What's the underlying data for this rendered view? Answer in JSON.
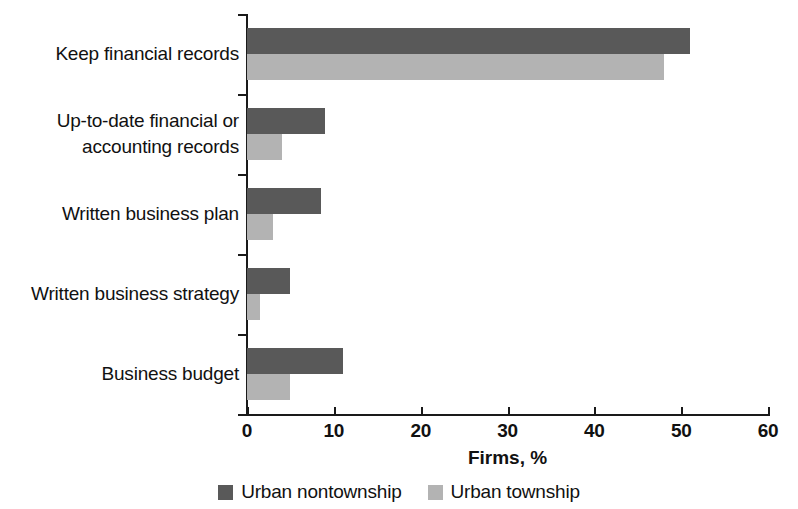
{
  "chart_data": {
    "type": "bar",
    "orientation": "horizontal",
    "title": "",
    "xlabel": "Firms, %",
    "ylabel": "",
    "xlim": [
      0,
      60
    ],
    "xticks": [
      0,
      10,
      20,
      30,
      40,
      50,
      60
    ],
    "grid": false,
    "legend_position": "bottom",
    "categories": [
      "Keep financial records",
      "Up-to-date financial or accounting records",
      "Written business plan",
      "Written business strategy",
      "Business budget"
    ],
    "category_label_lines": [
      [
        "Keep financial records"
      ],
      [
        "Up-to-date financial or",
        "accounting records"
      ],
      [
        "Written business plan"
      ],
      [
        "Written business strategy"
      ],
      [
        "Business budget"
      ]
    ],
    "series": [
      {
        "name": "Urban nontownship",
        "color": "#595959",
        "values": [
          51,
          9,
          8.5,
          5,
          11
        ]
      },
      {
        "name": "Urban township",
        "color": "#b3b3b3",
        "values": [
          48,
          4,
          3,
          1.5,
          5
        ]
      }
    ]
  },
  "axis": {
    "x_title": "Firms, %",
    "tick_labels": [
      "0",
      "10",
      "20",
      "30",
      "40",
      "50",
      "60"
    ]
  },
  "legend": {
    "items": [
      {
        "label": "Urban nontownship",
        "color": "#595959"
      },
      {
        "label": "Urban township",
        "color": "#b3b3b3"
      }
    ]
  },
  "colors": {
    "series_dark": "#595959",
    "series_light": "#b3b3b3",
    "axis": "#1a1a1a",
    "text": "#111111",
    "background": "#ffffff"
  }
}
